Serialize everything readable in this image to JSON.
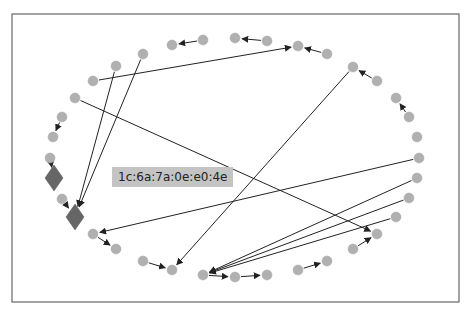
{
  "diagram": {
    "type": "network-graph",
    "frame": {
      "x": 12,
      "y": 14,
      "width": 447,
      "height": 288
    },
    "colors": {
      "node": "#b0b0b0",
      "highlight_node": "#666666",
      "edge": "#222222",
      "label_bg": "#c4c4c4",
      "frame": "#666666"
    },
    "label": {
      "text": "1c:6a:7a:0e:e0:4e",
      "x": 112,
      "y": 167
    },
    "nodes": [
      {
        "id": 0,
        "x": 172,
        "y": 45,
        "shape": "circle"
      },
      {
        "id": 1,
        "x": 203,
        "y": 40,
        "shape": "circle"
      },
      {
        "id": 2,
        "x": 235,
        "y": 38,
        "shape": "circle"
      },
      {
        "id": 3,
        "x": 267,
        "y": 41,
        "shape": "circle"
      },
      {
        "id": 4,
        "x": 298,
        "y": 46,
        "shape": "circle"
      },
      {
        "id": 5,
        "x": 327,
        "y": 54,
        "shape": "circle"
      },
      {
        "id": 6,
        "x": 353,
        "y": 67,
        "shape": "circle"
      },
      {
        "id": 7,
        "x": 377,
        "y": 81,
        "shape": "circle"
      },
      {
        "id": 8,
        "x": 396,
        "y": 98,
        "shape": "circle"
      },
      {
        "id": 9,
        "x": 409,
        "y": 117,
        "shape": "circle"
      },
      {
        "id": 10,
        "x": 417,
        "y": 137,
        "shape": "circle"
      },
      {
        "id": 11,
        "x": 419,
        "y": 158,
        "shape": "circle"
      },
      {
        "id": 12,
        "x": 417,
        "y": 178,
        "shape": "circle"
      },
      {
        "id": 13,
        "x": 409,
        "y": 198,
        "shape": "circle"
      },
      {
        "id": 14,
        "x": 396,
        "y": 217,
        "shape": "circle"
      },
      {
        "id": 15,
        "x": 377,
        "y": 234,
        "shape": "circle"
      },
      {
        "id": 16,
        "x": 353,
        "y": 249,
        "shape": "circle"
      },
      {
        "id": 17,
        "x": 327,
        "y": 261,
        "shape": "circle"
      },
      {
        "id": 18,
        "x": 298,
        "y": 270,
        "shape": "circle"
      },
      {
        "id": 19,
        "x": 267,
        "y": 275,
        "shape": "circle"
      },
      {
        "id": 20,
        "x": 235,
        "y": 277,
        "shape": "circle"
      },
      {
        "id": 21,
        "x": 203,
        "y": 275,
        "shape": "circle"
      },
      {
        "id": 22,
        "x": 172,
        "y": 270,
        "shape": "circle"
      },
      {
        "id": 23,
        "x": 143,
        "y": 261,
        "shape": "circle"
      },
      {
        "id": 24,
        "x": 116,
        "y": 249,
        "shape": "circle"
      },
      {
        "id": 25,
        "x": 93,
        "y": 234,
        "shape": "circle"
      },
      {
        "id": 26,
        "x": 75,
        "y": 217,
        "shape": "diamond"
      },
      {
        "id": 27,
        "x": 62,
        "y": 199,
        "shape": "circle"
      },
      {
        "id": 28,
        "x": 54,
        "y": 178,
        "shape": "diamond"
      },
      {
        "id": 29,
        "x": 50,
        "y": 158,
        "shape": "circle"
      },
      {
        "id": 30,
        "x": 53,
        "y": 137,
        "shape": "circle"
      },
      {
        "id": 31,
        "x": 62,
        "y": 117,
        "shape": "circle"
      },
      {
        "id": 32,
        "x": 75,
        "y": 98,
        "shape": "circle"
      },
      {
        "id": 33,
        "x": 93,
        "y": 81,
        "shape": "circle"
      },
      {
        "id": 34,
        "x": 116,
        "y": 66,
        "shape": "circle"
      },
      {
        "id": 35,
        "x": 143,
        "y": 54,
        "shape": "circle"
      }
    ],
    "edges": [
      {
        "from": 1,
        "to": 0
      },
      {
        "from": 3,
        "to": 2
      },
      {
        "from": 5,
        "to": 4
      },
      {
        "from": 33,
        "to": 4
      },
      {
        "from": 9,
        "to": 8
      },
      {
        "from": 7,
        "to": 6
      },
      {
        "from": 34,
        "to": 26
      },
      {
        "from": 35,
        "to": 26
      },
      {
        "from": 32,
        "to": 15
      },
      {
        "from": 6,
        "to": 22
      },
      {
        "from": 11,
        "to": 25
      },
      {
        "from": 12,
        "to": 21
      },
      {
        "from": 13,
        "to": 21
      },
      {
        "from": 14,
        "to": 21
      },
      {
        "from": 21,
        "to": 20
      },
      {
        "from": 20,
        "to": 19
      },
      {
        "from": 18,
        "to": 17
      },
      {
        "from": 16,
        "to": 15
      },
      {
        "from": 23,
        "to": 22
      },
      {
        "from": 25,
        "to": 24
      },
      {
        "from": 27,
        "to": 26
      },
      {
        "from": 29,
        "to": 28
      },
      {
        "from": 31,
        "to": 30
      }
    ]
  }
}
